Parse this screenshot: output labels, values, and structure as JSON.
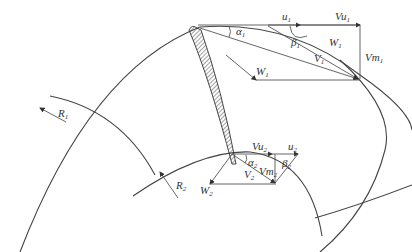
{
  "diagram": {
    "inlet": {
      "u": {
        "main": "u",
        "sub": "1"
      },
      "vu": {
        "main": "Vu",
        "sub": "1"
      },
      "w_top": {
        "main": "W",
        "sub": "1"
      },
      "w_left": {
        "main": "W",
        "sub": "1"
      },
      "v": {
        "main": "V",
        "sub": "1"
      },
      "vm": {
        "main": "Vm",
        "sub": "1"
      },
      "alpha": {
        "main": "α",
        "sub": "1"
      },
      "beta": {
        "main": "β",
        "sub": "1"
      }
    },
    "outlet": {
      "u": {
        "main": "u",
        "sub": "2"
      },
      "vu": {
        "main": "Vu",
        "sub": "2"
      },
      "w": {
        "main": "W",
        "sub": "2"
      },
      "v": {
        "main": "V",
        "sub": "2"
      },
      "vm": {
        "main": "Vm",
        "sub": "2"
      },
      "alpha": {
        "main": "α",
        "sub": "2"
      },
      "beta": {
        "main": "β",
        "sub": "2"
      }
    },
    "radii": {
      "r1": {
        "main": "R",
        "sub": "1"
      },
      "r2": {
        "main": "R",
        "sub": "2"
      }
    },
    "colors": {
      "line": "#555555",
      "text": "#333333",
      "background": "#ffffff"
    }
  }
}
